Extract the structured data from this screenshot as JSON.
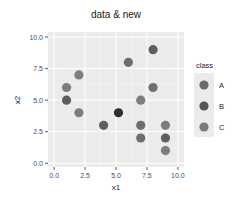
{
  "chart_data": {
    "type": "scatter",
    "title": "data & new",
    "xlabel": "x1",
    "ylabel": "x2",
    "xlim": [
      -0.5,
      10.5
    ],
    "ylim": [
      -0.3,
      10.4
    ],
    "xticks": [
      "0.0",
      "2.5",
      "5.0",
      "7.5",
      "10.0"
    ],
    "yticks": [
      "0.0",
      "2.5",
      "5.0",
      "7.5",
      "10.0"
    ],
    "grid": true,
    "legend": {
      "title": "class",
      "position": "right",
      "entries": [
        {
          "label": "A",
          "color": "#6b6b6b"
        },
        {
          "label": "B",
          "color": "#555555"
        },
        {
          "label": "C",
          "color": "#7a7a7a"
        }
      ]
    },
    "points": [
      {
        "x": 1,
        "y": 6,
        "color": "#7d7d7d"
      },
      {
        "x": 1,
        "y": 5,
        "color": "#5e5e5e"
      },
      {
        "x": 2,
        "y": 7,
        "color": "#7d7d7d"
      },
      {
        "x": 2,
        "y": 4,
        "color": "#7d7d7d"
      },
      {
        "x": 4,
        "y": 3,
        "color": "#5e5e5e"
      },
      {
        "x": 5.2,
        "y": 4,
        "color": "#2e2e2e"
      },
      {
        "x": 6,
        "y": 8,
        "color": "#6e6e6e"
      },
      {
        "x": 7,
        "y": 5,
        "color": "#7d7d7d"
      },
      {
        "x": 7,
        "y": 3,
        "color": "#6e6e6e"
      },
      {
        "x": 7,
        "y": 2,
        "color": "#6e6e6e"
      },
      {
        "x": 8,
        "y": 9,
        "color": "#5e5e5e"
      },
      {
        "x": 8,
        "y": 6,
        "color": "#6e6e6e"
      },
      {
        "x": 9,
        "y": 3,
        "color": "#7d7d7d"
      },
      {
        "x": 9,
        "y": 2,
        "color": "#5e5e5e"
      },
      {
        "x": 9,
        "y": 1,
        "color": "#7d7d7d"
      }
    ]
  },
  "colors": {
    "panel_bg": "#ebebeb",
    "grid_major": "#ffffff",
    "legend_key_bg": "#ebebeb"
  }
}
